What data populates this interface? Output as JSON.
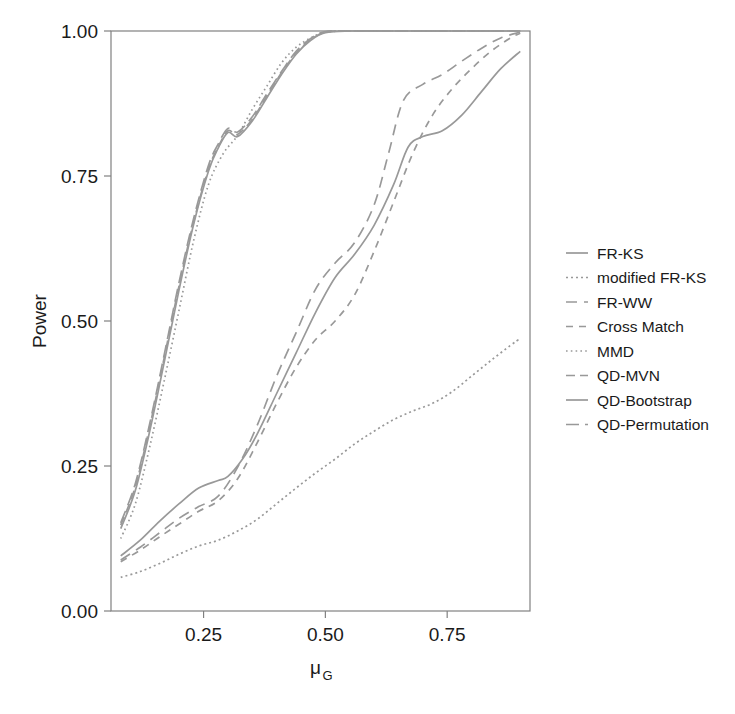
{
  "chart_data": {
    "type": "line",
    "title": "",
    "xlabel": "μ_G",
    "xlabel_base": "μ",
    "xlabel_sub": "G",
    "ylabel": "Power",
    "xlim": [
      0.06,
      0.92
    ],
    "ylim": [
      0.0,
      1.0
    ],
    "grid": false,
    "legend_position": "right",
    "xticks": [
      0.25,
      0.5,
      0.75
    ],
    "xtick_labels": [
      "0.25",
      "0.50",
      "0.75"
    ],
    "yticks": [
      0.0,
      0.25,
      0.5,
      0.75,
      1.0
    ],
    "ytick_labels": [
      "0.00",
      "0.25",
      "0.50",
      "0.75",
      "1.00"
    ],
    "line_color": "#999999",
    "axis_color": "#808080",
    "series": [
      {
        "name": "FR-KS",
        "dash": "solid",
        "x": [
          0.08,
          0.12,
          0.16,
          0.2,
          0.24,
          0.28,
          0.3,
          0.33,
          0.36,
          0.4,
          0.44,
          0.48,
          0.52,
          0.56,
          0.6,
          0.64,
          0.67,
          0.7,
          0.74,
          0.78,
          0.82,
          0.86,
          0.9
        ],
        "y": [
          0.095,
          0.122,
          0.155,
          0.185,
          0.212,
          0.225,
          0.232,
          0.262,
          0.305,
          0.375,
          0.445,
          0.515,
          0.575,
          0.615,
          0.665,
          0.735,
          0.8,
          0.818,
          0.828,
          0.855,
          0.895,
          0.935,
          0.965
        ]
      },
      {
        "name": "modified FR-KS",
        "dash": "dotted-fine",
        "x": [
          0.08,
          0.12,
          0.16,
          0.2,
          0.24,
          0.28,
          0.32,
          0.36,
          0.4,
          0.44,
          0.48,
          0.52,
          0.56,
          0.6,
          0.64,
          0.68,
          0.72,
          0.76,
          0.8,
          0.84,
          0.88,
          0.9
        ],
        "y": [
          0.058,
          0.068,
          0.082,
          0.098,
          0.112,
          0.122,
          0.138,
          0.158,
          0.185,
          0.212,
          0.238,
          0.262,
          0.288,
          0.31,
          0.33,
          0.345,
          0.358,
          0.378,
          0.405,
          0.432,
          0.458,
          0.47
        ]
      },
      {
        "name": "FR-WW",
        "dash": "dashed-long",
        "x": [
          0.08,
          0.12,
          0.16,
          0.2,
          0.24,
          0.28,
          0.32,
          0.36,
          0.4,
          0.44,
          0.48,
          0.52,
          0.56,
          0.6,
          0.63,
          0.66,
          0.7,
          0.74,
          0.78,
          0.82,
          0.86,
          0.9
        ],
        "y": [
          0.088,
          0.11,
          0.135,
          0.16,
          0.18,
          0.198,
          0.248,
          0.32,
          0.405,
          0.48,
          0.555,
          0.6,
          0.635,
          0.7,
          0.79,
          0.88,
          0.908,
          0.925,
          0.948,
          0.97,
          0.988,
          0.998
        ]
      },
      {
        "name": "Cross Match",
        "dash": "dashed-short",
        "x": [
          0.08,
          0.12,
          0.16,
          0.2,
          0.24,
          0.28,
          0.32,
          0.36,
          0.4,
          0.44,
          0.48,
          0.52,
          0.56,
          0.6,
          0.64,
          0.68,
          0.72,
          0.76,
          0.8,
          0.84,
          0.88,
          0.9
        ],
        "y": [
          0.085,
          0.105,
          0.128,
          0.15,
          0.172,
          0.19,
          0.228,
          0.29,
          0.358,
          0.42,
          0.468,
          0.5,
          0.545,
          0.62,
          0.705,
          0.79,
          0.855,
          0.9,
          0.935,
          0.965,
          0.988,
          0.996
        ]
      },
      {
        "name": "MMD",
        "dash": "dotted",
        "x": [
          0.08,
          0.11,
          0.14,
          0.17,
          0.2,
          0.23,
          0.26,
          0.29,
          0.32,
          0.35,
          0.38,
          0.41,
          0.44,
          0.47,
          0.5,
          0.55,
          0.6,
          0.7,
          0.8,
          0.9
        ],
        "y": [
          0.125,
          0.185,
          0.285,
          0.4,
          0.52,
          0.64,
          0.735,
          0.788,
          0.82,
          0.865,
          0.905,
          0.945,
          0.972,
          0.988,
          0.998,
          1.0,
          1.0,
          1.0,
          1.0,
          1.0
        ]
      },
      {
        "name": "QD-MVN",
        "dash": "dashdot",
        "x": [
          0.08,
          0.11,
          0.14,
          0.17,
          0.2,
          0.23,
          0.26,
          0.28,
          0.3,
          0.32,
          0.35,
          0.38,
          0.41,
          0.44,
          0.47,
          0.5,
          0.55,
          0.62,
          0.7,
          0.8,
          0.9
        ],
        "y": [
          0.148,
          0.215,
          0.32,
          0.44,
          0.562,
          0.672,
          0.762,
          0.8,
          0.828,
          0.822,
          0.848,
          0.888,
          0.928,
          0.962,
          0.985,
          0.998,
          1.0,
          1.0,
          1.0,
          1.0,
          1.0
        ]
      },
      {
        "name": "QD-Bootstrap",
        "dash": "solid",
        "x": [
          0.08,
          0.11,
          0.14,
          0.17,
          0.2,
          0.23,
          0.26,
          0.28,
          0.3,
          0.32,
          0.35,
          0.38,
          0.41,
          0.44,
          0.47,
          0.5,
          0.55,
          0.62,
          0.7,
          0.8,
          0.9
        ],
        "y": [
          0.142,
          0.208,
          0.312,
          0.432,
          0.555,
          0.668,
          0.758,
          0.798,
          0.825,
          0.818,
          0.845,
          0.885,
          0.925,
          0.96,
          0.984,
          0.997,
          1.0,
          1.0,
          1.0,
          1.0,
          1.0
        ]
      },
      {
        "name": "QD-Permutation",
        "dash": "dashdot-long",
        "x": [
          0.08,
          0.11,
          0.14,
          0.17,
          0.2,
          0.23,
          0.26,
          0.28,
          0.3,
          0.32,
          0.35,
          0.38,
          0.41,
          0.44,
          0.47,
          0.5,
          0.55,
          0.62,
          0.7,
          0.8,
          0.9
        ],
        "y": [
          0.152,
          0.22,
          0.325,
          0.445,
          0.568,
          0.678,
          0.768,
          0.805,
          0.832,
          0.826,
          0.852,
          0.892,
          0.93,
          0.965,
          0.987,
          0.999,
          1.0,
          1.0,
          1.0,
          1.0,
          1.0
        ]
      }
    ]
  },
  "legend": {
    "items": [
      {
        "label": "FR-KS",
        "dash": "solid"
      },
      {
        "label": "modified FR-KS",
        "dash": "dotted-fine"
      },
      {
        "label": "FR-WW",
        "dash": "dashed-long"
      },
      {
        "label": "Cross Match",
        "dash": "dashed-short"
      },
      {
        "label": "MMD",
        "dash": "dotted"
      },
      {
        "label": "QD-MVN",
        "dash": "dashdot"
      },
      {
        "label": "QD-Bootstrap",
        "dash": "solid"
      },
      {
        "label": "QD-Permutation",
        "dash": "dashdot-long"
      }
    ]
  }
}
